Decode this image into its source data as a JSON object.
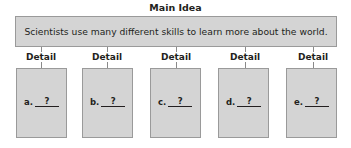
{
  "title": "Main Idea",
  "main_idea": "Scientists use many different skills to learn more about the world.",
  "details": [
    {
      "header": "Detail",
      "letter": "a.",
      "value": "?"
    },
    {
      "header": "Detail",
      "letter": "b.",
      "value": "?"
    },
    {
      "header": "Detail",
      "letter": "c.",
      "value": "?"
    },
    {
      "header": "Detail",
      "letter": "d.",
      "value": "?"
    },
    {
      "header": "Detail",
      "letter": "e.",
      "value": "?"
    }
  ],
  "colors": {
    "box_fill": "#d4d4d4",
    "border": "#9a9a9a",
    "text": "#231f20"
  }
}
